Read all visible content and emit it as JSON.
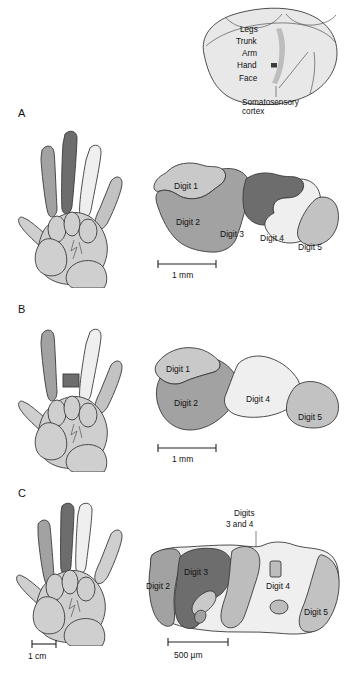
{
  "figure": {
    "panels": [
      {
        "letter": "A",
        "condition": "normal hand"
      },
      {
        "letter": "B",
        "condition": "digit 3 amputated"
      },
      {
        "letter": "C",
        "condition": "digits 3 and 4 fused (syndactyly)"
      }
    ]
  },
  "brain_inset": {
    "labels": [
      "Legs",
      "Trunk",
      "Arm",
      "Hand",
      "Face"
    ],
    "callout_line1": "Somatosensory",
    "callout_line2": "cortex"
  },
  "panel_a": {
    "letter": "A",
    "map_labels": [
      "Digit 1",
      "Digit 2",
      "Digit 3",
      "Digit 4",
      "Digit 5"
    ],
    "scale_label": "1 mm"
  },
  "panel_b": {
    "letter": "B",
    "map_labels": [
      "Digit 1",
      "Digit 2",
      "Digit 4",
      "Digit 5"
    ],
    "scale_label": "1 mm"
  },
  "panel_c": {
    "letter": "C",
    "map_labels": [
      "Digit 2",
      "Digit 3",
      "Digit 4",
      "Digit 5"
    ],
    "annotation_line1": "Digits",
    "annotation_line2": "3 and 4",
    "hand_scale_label": "1 cm",
    "map_scale_label": "500 µm"
  },
  "colors": {
    "digit1": "#c9c9c9",
    "digit2": "#a2a2a2",
    "digit3": "#6d6d6d",
    "digit4": "#efefef",
    "digit5": "#c2c2c2",
    "hand_fill": "#cfcfcf",
    "brain_fill": "#e3e3e3",
    "strip": "#bdbdbd",
    "outline": "#3a3a3a",
    "text": "#111111"
  }
}
